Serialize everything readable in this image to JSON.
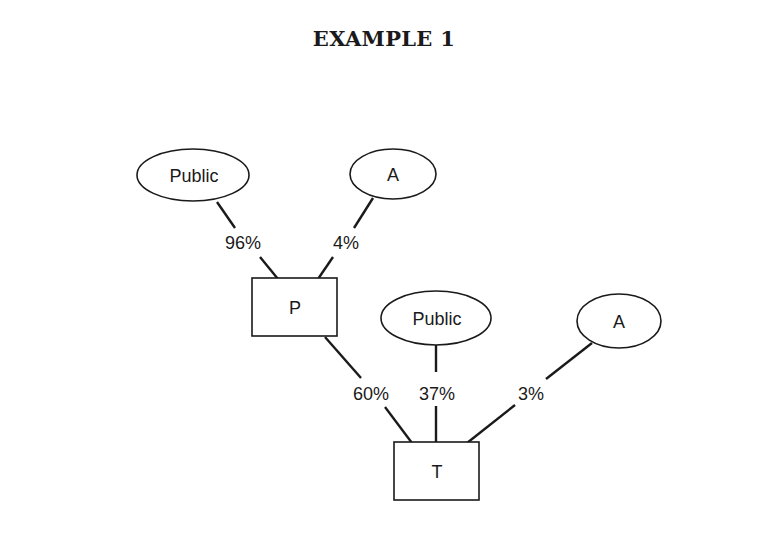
{
  "title": "EXAMPLE 1",
  "nodes": {
    "public_top": {
      "label": "Public",
      "shape": "ellipse",
      "cx": 193,
      "cy": 175,
      "rx": 56,
      "ry": 26
    },
    "a_top": {
      "label": "A",
      "shape": "ellipse",
      "cx": 393,
      "cy": 174,
      "rx": 43,
      "ry": 25
    },
    "p": {
      "label": "P",
      "shape": "rect",
      "x": 252,
      "y": 278,
      "w": 85,
      "h": 58
    },
    "public_bottom": {
      "label": "Public",
      "shape": "ellipse",
      "cx": 436,
      "cy": 318,
      "rx": 55,
      "ry": 27
    },
    "a_bottom": {
      "label": "A",
      "shape": "ellipse",
      "cx": 619,
      "cy": 321,
      "rx": 42,
      "ry": 27
    },
    "t": {
      "label": "T",
      "shape": "rect",
      "x": 394,
      "y": 442,
      "w": 85,
      "h": 58
    }
  },
  "edges": [
    {
      "from": "public_top",
      "to": "p",
      "label": "96%"
    },
    {
      "from": "a_top",
      "to": "p",
      "label": "4%"
    },
    {
      "from": "p",
      "to": "t",
      "label": "60%"
    },
    {
      "from": "public_bottom",
      "to": "t",
      "label": "37%"
    },
    {
      "from": "a_bottom",
      "to": "t",
      "label": "3%"
    }
  ]
}
